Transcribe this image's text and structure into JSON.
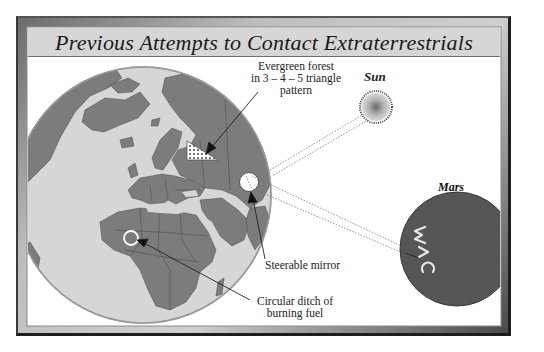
{
  "title": "Previous Attempts to Contact Extraterrestrials",
  "labels": {
    "forest": [
      "Evergreen forest",
      "in 3 – 4 – 5 triangle",
      "pattern"
    ],
    "sun": "Sun",
    "mars": "Mars",
    "mirror": "Steerable mirror",
    "ditch": [
      "Circular ditch of",
      "burning fuel"
    ],
    "mars_glyphs": "W∧C"
  },
  "colors": {
    "land": "#7c7c7c",
    "ocean": "#d4d4d4",
    "mars": "#565656",
    "frame_dark": "#1e1e1e",
    "title_bg": "#d8d8d8"
  }
}
